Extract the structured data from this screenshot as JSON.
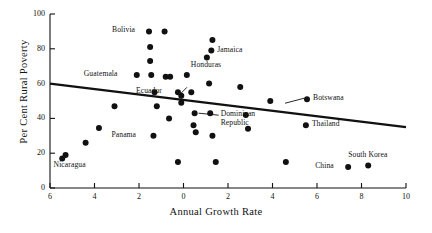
{
  "chart_data": {
    "type": "scatter",
    "title": "",
    "xlabel": "Annual Growth Rate",
    "ylabel": "Per Cent Rural Poverty",
    "xlim": [
      -6,
      10
    ],
    "ylim": [
      0,
      100
    ],
    "grid": false,
    "legend": null,
    "xticks": [
      "6",
      "4",
      "2",
      "0",
      "2",
      "4",
      "6",
      "8",
      "10"
    ],
    "xtick_values": [
      -6,
      -4,
      -2,
      0,
      2,
      4,
      6,
      8,
      10
    ],
    "yticks": [
      "0",
      "20",
      "40",
      "60",
      "80",
      "100"
    ],
    "ytick_values": [
      0,
      20,
      40,
      60,
      80,
      100
    ],
    "note": "Left half of the x axis is negative growth; tick labels are printed without minus signs.",
    "marker": {
      "shape": "circle",
      "color": "#111111",
      "size": 4.2
    },
    "trendline": {
      "type": "linear-fit",
      "color": "#111111",
      "width": 2.2,
      "x_start": -6,
      "y_start": 60,
      "x_end": 10,
      "y_end": 35
    },
    "points": [
      {
        "label": "",
        "x": -5.45,
        "y": 17
      },
      {
        "label": "Nicaragua",
        "x": -5.3,
        "y": 19,
        "label_pos": "below-left"
      },
      {
        "label": "",
        "x": -4.4,
        "y": 26
      },
      {
        "label": "",
        "x": -3.8,
        "y": 34.5
      },
      {
        "label": "",
        "x": -3.1,
        "y": 47
      },
      {
        "label": "Guatemala",
        "x": -2.1,
        "y": 65,
        "label_pos": "left"
      },
      {
        "label": "",
        "x": -1.55,
        "y": 90,
        "pair": "Bolivia"
      },
      {
        "label": "Bolivia",
        "x": -1.55,
        "y": 90,
        "label_pos": "left",
        "is_label_only": true
      },
      {
        "label": "",
        "x": -1.5,
        "y": 81
      },
      {
        "label": "",
        "x": -1.5,
        "y": 73
      },
      {
        "label": "",
        "x": -1.45,
        "y": 65
      },
      {
        "label": "",
        "x": -1.3,
        "y": 55
      },
      {
        "label": "",
        "x": -1.2,
        "y": 47
      },
      {
        "label": "Panama",
        "x": -1.35,
        "y": 30,
        "label_pos": "left"
      },
      {
        "label": "",
        "x": -0.85,
        "y": 90
      },
      {
        "label": "",
        "x": -0.8,
        "y": 64
      },
      {
        "label": "",
        "x": -0.6,
        "y": 64
      },
      {
        "label": "",
        "x": -0.65,
        "y": 40
      },
      {
        "label": "Ecuador",
        "x": -0.25,
        "y": 55,
        "label_pos": "left"
      },
      {
        "label": "",
        "x": -0.1,
        "y": 53
      },
      {
        "label": "",
        "x": -0.1,
        "y": 49
      },
      {
        "label": "",
        "x": -0.25,
        "y": 15
      },
      {
        "label": "Honduras",
        "x": 0.15,
        "y": 65,
        "label_pos": "above-right"
      },
      {
        "label": "",
        "x": 0.35,
        "y": 55
      },
      {
        "label": "Dominican Republic",
        "x": 0.5,
        "y": 43,
        "label_pos": "right"
      },
      {
        "label": "",
        "x": 0.45,
        "y": 36
      },
      {
        "label": "",
        "x": 0.55,
        "y": 32
      },
      {
        "label": "Jamaica",
        "x": 1.25,
        "y": 79,
        "label_pos": "right"
      },
      {
        "label": "",
        "x": 1.05,
        "y": 75
      },
      {
        "label": "",
        "x": 1.3,
        "y": 85
      },
      {
        "label": "",
        "x": 1.15,
        "y": 60
      },
      {
        "label": "",
        "x": 1.2,
        "y": 43
      },
      {
        "label": "",
        "x": 1.3,
        "y": 30
      },
      {
        "label": "",
        "x": 1.45,
        "y": 15
      },
      {
        "label": "",
        "x": 2.55,
        "y": 58
      },
      {
        "label": "",
        "x": 2.8,
        "y": 42
      },
      {
        "label": "",
        "x": 2.9,
        "y": 34
      },
      {
        "label": "",
        "x": 3.9,
        "y": 50
      },
      {
        "label": "Botswana",
        "x": 5.55,
        "y": 51,
        "label_pos": "right"
      },
      {
        "label": "",
        "x": 4.6,
        "y": 15
      },
      {
        "label": "Thailand",
        "x": 5.5,
        "y": 36,
        "label_pos": "right"
      },
      {
        "label": "China",
        "x": 7.4,
        "y": 12,
        "label_pos": "left"
      },
      {
        "label": "South Korea",
        "x": 8.3,
        "y": 13,
        "label_pos": "above"
      }
    ]
  },
  "axes": {
    "x_title": "Annual Growth Rate",
    "y_title": "Per Cent Rural Poverty"
  },
  "point_labels": {
    "nicaragua": "Nicaragua",
    "guatemala": "Guatemala",
    "bolivia": "Bolivia",
    "panama": "Panama",
    "ecuador": "Ecuador",
    "honduras": "Honduras",
    "dominican_1": "Dominican",
    "dominican_2": "Republic",
    "jamaica": "Jamaica",
    "botswana": "Botswana",
    "thailand": "Thailand",
    "china": "China",
    "south_korea": "South Korea"
  }
}
